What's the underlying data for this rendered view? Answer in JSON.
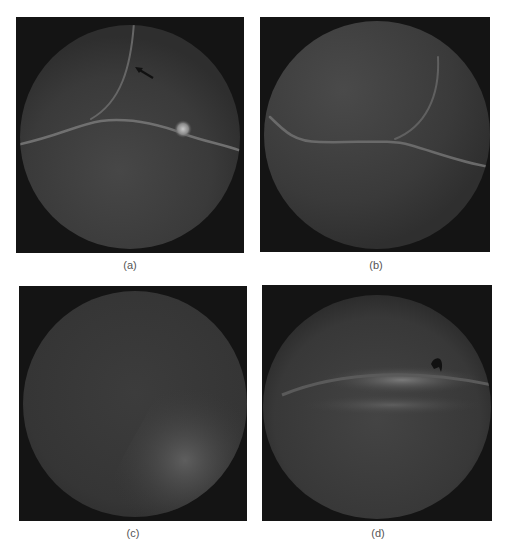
{
  "figure": {
    "panels": [
      {
        "id": "a",
        "label": "(a)",
        "annotation": "arrow-pointing-up-left"
      },
      {
        "id": "b",
        "label": "(b)"
      },
      {
        "id": "c",
        "label": "(c)"
      },
      {
        "id": "d",
        "label": "(d)",
        "annotation": "arrowhead-marker"
      }
    ]
  },
  "colors": {
    "background": "#ffffff",
    "frame": "#141414",
    "field": "#3c3c3c",
    "vessel": "#6e6e6e",
    "caption": "#555555"
  }
}
